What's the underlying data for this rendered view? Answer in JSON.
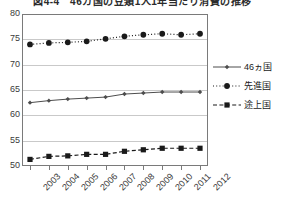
{
  "chart_data": {
    "type": "line",
    "title": "図4-4　46カ国の豆類1人1年当たり消費の推移",
    "title_clipped": true,
    "xlabel": "",
    "ylabel": "",
    "categories": [
      "2003",
      "2004",
      "2005",
      "2006",
      "2007",
      "2008",
      "2009",
      "2010",
      "2011",
      "2012"
    ],
    "x": [
      2003,
      2004,
      2005,
      2006,
      2007,
      2008,
      2009,
      2010,
      2011,
      2012
    ],
    "ylim": [
      50,
      80
    ],
    "yticks": [
      50,
      55,
      60,
      65,
      70,
      75,
      80
    ],
    "grid": true,
    "grid_axis": "y",
    "legend_position": "right",
    "series": [
      {
        "name": "46ヵ国",
        "marker": "diamond",
        "linestyle": "solid",
        "color": "#4d4d4d",
        "values": [
          62.5,
          62.9,
          63.2,
          63.4,
          63.6,
          64.2,
          64.4,
          64.6,
          64.6,
          64.6
        ]
      },
      {
        "name": "先進国",
        "marker": "circle",
        "linestyle": "dotted",
        "color": "#1a1a1a",
        "values": [
          74.0,
          74.3,
          74.4,
          74.6,
          75.1,
          75.6,
          75.9,
          76.1,
          75.9,
          76.1
        ]
      },
      {
        "name": "途上国",
        "marker": "square",
        "linestyle": "dashed",
        "color": "#1a1a1a",
        "values": [
          51.3,
          51.9,
          52.0,
          52.3,
          52.3,
          52.9,
          53.2,
          53.5,
          53.5,
          53.5
        ]
      }
    ]
  },
  "legend": {
    "items": [
      {
        "label": "46ヵ国"
      },
      {
        "label": "先進国"
      },
      {
        "label": "途上国"
      }
    ]
  },
  "axes": {
    "y_tick_labels": [
      "80",
      "75",
      "70",
      "65",
      "60",
      "55",
      "50"
    ],
    "x_tick_labels": [
      "2003",
      "2004",
      "2005",
      "2006",
      "2007",
      "2008",
      "2009",
      "2010",
      "2011",
      "2012"
    ]
  },
  "colors": {
    "frame": "#7a7a7a",
    "grid": "#c9c9c9",
    "ink": "#1a1a1a",
    "background": "#ffffff"
  }
}
